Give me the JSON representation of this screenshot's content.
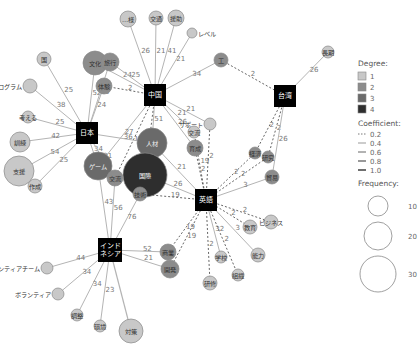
{
  "colors": {
    "degree1": "#c8c8c8",
    "degree2": "#8c8c8c",
    "degree3": "#6a6a6a",
    "degree4": "#2e2e2e",
    "hub": "#000000",
    "edge_solid": "#b4b4b4",
    "edge_dashed": "#555555"
  },
  "hubs": [
    {
      "id": "japan",
      "label": "日本",
      "x": 87,
      "y": 133,
      "size": 22
    },
    {
      "id": "china",
      "label": "中国",
      "x": 155,
      "y": 95,
      "size": 22
    },
    {
      "id": "taiwan",
      "label": "台湾",
      "x": 285,
      "y": 96,
      "size": 22
    },
    {
      "id": "english",
      "label": "英語",
      "x": 206,
      "y": 200,
      "size": 22
    },
    {
      "id": "indonesia",
      "label": "インド\nネシア",
      "x": 110,
      "y": 250,
      "size": 24
    }
  ],
  "nodes": [
    {
      "id": "n_sho",
      "label": "…様",
      "x": 128,
      "y": 19,
      "r": 8,
      "degree": 1
    },
    {
      "id": "n_kotsu",
      "label": "交通",
      "x": 156,
      "y": 18,
      "r": 7,
      "degree": 1
    },
    {
      "id": "n_enjo",
      "label": "援助",
      "x": 176,
      "y": 18,
      "r": 8,
      "degree": 1
    },
    {
      "id": "n_level",
      "label": "レベル",
      "x": 192,
      "y": 33,
      "r": 5,
      "degree": 1,
      "outside": true
    },
    {
      "id": "n_ko",
      "label": "工",
      "x": 221,
      "y": 60,
      "r": 7,
      "degree": 2
    },
    {
      "id": "n_jinkou",
      "label": "長期",
      "x": 328,
      "y": 52,
      "r": 6,
      "degree": 1
    },
    {
      "id": "n_bunka",
      "label": "文化",
      "x": 95,
      "y": 63,
      "r": 12,
      "degree": 2
    },
    {
      "id": "n_ryoko",
      "label": "旅行",
      "x": 110,
      "y": 62,
      "r": 9,
      "degree": 2
    },
    {
      "id": "n_tairiku",
      "label": "体験",
      "x": 104,
      "y": 86,
      "r": 8,
      "degree": 2
    },
    {
      "id": "n_kuni",
      "label": "国",
      "x": 44,
      "y": 59,
      "r": 7,
      "degree": 1
    },
    {
      "id": "n_program",
      "label": "プログラム",
      "x": 30,
      "y": 86,
      "r": 7,
      "degree": 1,
      "outside_left": true
    },
    {
      "id": "n_kangaeru",
      "label": "考える",
      "x": 28,
      "y": 117,
      "r": 6,
      "degree": 1
    },
    {
      "id": "n_kunren",
      "label": "訓練",
      "x": 20,
      "y": 142,
      "r": 10,
      "degree": 1
    },
    {
      "id": "n_shien",
      "label": "支援",
      "x": 19,
      "y": 171,
      "r": 15,
      "degree": 1
    },
    {
      "id": "n_sakusei",
      "label": "作成",
      "x": 35,
      "y": 186,
      "r": 7,
      "degree": 1
    },
    {
      "id": "n_jinzai",
      "label": "人材",
      "x": 152,
      "y": 143,
      "r": 15,
      "degree": 3
    },
    {
      "id": "n_support",
      "label": "サポート",
      "x": 210,
      "y": 124,
      "r": 6,
      "degree": 1,
      "outside_left": true
    },
    {
      "id": "n_ko2",
      "label": "交流",
      "x": 194,
      "y": 132,
      "r": 6,
      "degree": 1
    },
    {
      "id": "n_kyoiku",
      "label": "育成",
      "x": 195,
      "y": 148,
      "r": 8,
      "degree": 2
    },
    {
      "id": "n_game",
      "label": "ゲーム",
      "x": 98,
      "y": 166,
      "r": 14,
      "degree": 3
    },
    {
      "id": "n_kokusai",
      "label": "国際",
      "x": 145,
      "y": 175,
      "r": 22,
      "degree": 4
    },
    {
      "id": "n_shakai",
      "label": "交流",
      "x": 115,
      "y": 178,
      "r": 8,
      "degree": 2
    },
    {
      "id": "n_gijutsu",
      "label": "技術",
      "x": 140,
      "y": 194,
      "r": 7,
      "degree": 2
    },
    {
      "id": "n_keizai",
      "label": "経済",
      "x": 255,
      "y": 153,
      "r": 6,
      "degree": 2
    },
    {
      "id": "n_kenkyu",
      "label": "研究",
      "x": 268,
      "y": 157,
      "r": 6,
      "degree": 2
    },
    {
      "id": "n_bouei",
      "label": "貿易",
      "x": 272,
      "y": 177,
      "r": 7,
      "degree": 2
    },
    {
      "id": "n_kyouiku2",
      "label": "教育",
      "x": 250,
      "y": 227,
      "r": 7,
      "degree": 1
    },
    {
      "id": "n_nihongo",
      "label": "ビジネス",
      "x": 271,
      "y": 222,
      "r": 7,
      "degree": 1
    },
    {
      "id": "n_kinou",
      "label": "能力",
      "x": 258,
      "y": 255,
      "r": 7,
      "degree": 1
    },
    {
      "id": "n_gakko",
      "label": "学校",
      "x": 221,
      "y": 257,
      "r": 6,
      "degree": 1
    },
    {
      "id": "n_soshiki",
      "label": "組織",
      "x": 238,
      "y": 275,
      "r": 6,
      "degree": 1
    },
    {
      "id": "n_kaigi",
      "label": "研修",
      "x": 210,
      "y": 283,
      "r": 7,
      "degree": 1
    },
    {
      "id": "n_shougyo",
      "label": "商業",
      "x": 168,
      "y": 252,
      "r": 8,
      "degree": 2
    },
    {
      "id": "n_kaihatsu",
      "label": "開発",
      "x": 170,
      "y": 269,
      "r": 9,
      "degree": 2
    },
    {
      "id": "n_volteam",
      "label": "ボランティアチーム",
      "x": 47,
      "y": 268,
      "r": 6,
      "degree": 1,
      "outside_left": true
    },
    {
      "id": "n_volunteer",
      "label": "ボランティア",
      "x": 58,
      "y": 294,
      "r": 6,
      "degree": 1,
      "outside_left": true
    },
    {
      "id": "n_chosa",
      "label": "調整",
      "x": 77,
      "y": 315,
      "r": 6,
      "degree": 1
    },
    {
      "id": "n_kankyo",
      "label": "環境",
      "x": 100,
      "y": 326,
      "r": 6,
      "degree": 1
    },
    {
      "id": "n_taisaku",
      "label": "対策",
      "x": 131,
      "y": 331,
      "r": 12,
      "degree": 1
    }
  ],
  "edges": [
    {
      "from": "china",
      "to": "n_sho",
      "weight": "26",
      "style": "solid"
    },
    {
      "from": "china",
      "to": "n_kotsu",
      "weight": "21",
      "style": "solid"
    },
    {
      "from": "china",
      "to": "n_enjo",
      "weight": "41",
      "style": "solid"
    },
    {
      "from": "china",
      "to": "n_level",
      "weight": "21",
      "style": "solid"
    },
    {
      "from": "china",
      "to": "n_ko",
      "weight": "34",
      "style": "solid"
    },
    {
      "from": "china",
      "to": "n_bunka",
      "weight": "24",
      "style": "solid"
    },
    {
      "from": "china",
      "to": "n_ryoko",
      "weight": "25",
      "style": "solid"
    },
    {
      "from": "china",
      "to": "n_tairiku",
      "weight": "2",
      "style": "dashed"
    },
    {
      "from": "china",
      "to": "n_support",
      "weight": "21",
      "style": "solid"
    },
    {
      "from": "china",
      "to": "n_ko2",
      "weight": "21",
      "style": "solid"
    },
    {
      "from": "china",
      "to": "n_kyoiku",
      "weight": "26",
      "style": "solid"
    },
    {
      "from": "china",
      "to": "n_jinzai",
      "weight": "51",
      "style": "solid"
    },
    {
      "from": "china",
      "to": "n_kokusai",
      "weight": "2",
      "style": "dashed"
    },
    {
      "from": "china",
      "to": "n_shakai",
      "weight": "19",
      "style": "dashed"
    },
    {
      "from": "china",
      "to": "n_game",
      "weight": "27",
      "style": "solid"
    },
    {
      "from": "taiwan",
      "to": "n_ko",
      "weight": "2",
      "style": "dashed"
    },
    {
      "from": "taiwan",
      "to": "n_jinkou",
      "weight": "26",
      "style": "solid"
    },
    {
      "from": "taiwan",
      "to": "n_keizai",
      "weight": "2",
      "style": "dashed"
    },
    {
      "from": "taiwan",
      "to": "n_kenkyu",
      "weight": "2",
      "style": "dashed"
    },
    {
      "from": "taiwan",
      "to": "n_bouei",
      "weight": "26",
      "style": "solid"
    },
    {
      "from": "japan",
      "to": "n_kuni",
      "weight": "25",
      "style": "solid"
    },
    {
      "from": "japan",
      "to": "n_program",
      "weight": "38",
      "style": "solid"
    },
    {
      "from": "japan",
      "to": "n_kangaeru",
      "weight": "25",
      "style": "solid"
    },
    {
      "from": "japan",
      "to": "n_kunren",
      "weight": "42",
      "style": "solid"
    },
    {
      "from": "japan",
      "to": "n_shien",
      "weight": "54",
      "style": "solid"
    },
    {
      "from": "japan",
      "to": "n_sakusei",
      "weight": "25",
      "style": "solid"
    },
    {
      "from": "japan",
      "to": "n_bunka",
      "weight": "52",
      "style": "solid"
    },
    {
      "from": "japan",
      "to": "n_ryoko",
      "weight": "25",
      "style": "solid"
    },
    {
      "from": "japan",
      "to": "n_tairiku",
      "weight": "24",
      "style": "solid"
    },
    {
      "from": "japan",
      "to": "n_jinzai",
      "weight": "36",
      "style": "solid"
    },
    {
      "from": "japan",
      "to": "n_game",
      "weight": "34",
      "style": "solid"
    },
    {
      "from": "japan",
      "to": "n_shakai",
      "weight": "31",
      "style": "solid"
    },
    {
      "from": "english",
      "to": "n_kokusai",
      "weight": "26",
      "style": "solid"
    },
    {
      "from": "english",
      "to": "n_jinzai",
      "weight": "21",
      "style": "solid"
    },
    {
      "from": "english",
      "to": "n_gijutsu",
      "weight": "19",
      "style": "dashed"
    },
    {
      "from": "english",
      "to": "n_kyoiku",
      "weight": "2",
      "style": "dashed"
    },
    {
      "from": "english",
      "to": "n_ko2",
      "weight": "19",
      "style": "dashed"
    },
    {
      "from": "english",
      "to": "n_support",
      "weight": "2",
      "style": "dashed"
    },
    {
      "from": "english",
      "to": "n_keizai",
      "weight": "2",
      "style": "dashed"
    },
    {
      "from": "english",
      "to": "n_kenkyu",
      "weight": "2",
      "style": "dashed"
    },
    {
      "from": "english",
      "to": "n_bouei",
      "weight": "3",
      "style": "solid"
    },
    {
      "from": "english",
      "to": "n_nihongo",
      "weight": "2",
      "style": "dashed"
    },
    {
      "from": "english",
      "to": "n_kyouiku2",
      "weight": "2",
      "style": "dashed"
    },
    {
      "from": "english",
      "to": "n_kinou",
      "weight": "3",
      "style": "solid"
    },
    {
      "from": "english",
      "to": "n_gakko",
      "weight": "32",
      "style": "solid"
    },
    {
      "from": "english",
      "to": "n_soshiki",
      "weight": "2",
      "style": "dashed"
    },
    {
      "from": "english",
      "to": "n_kaigi",
      "weight": "2",
      "style": "dashed"
    },
    {
      "from": "english",
      "to": "n_shougyo",
      "weight": "19",
      "style": "dashed"
    },
    {
      "from": "english",
      "to": "n_kaihatsu",
      "weight": "19",
      "style": "dashed"
    },
    {
      "from": "indonesia",
      "to": "n_game",
      "weight": "43",
      "style": "solid"
    },
    {
      "from": "indonesia",
      "to": "n_shakai",
      "weight": "56",
      "style": "solid"
    },
    {
      "from": "indonesia",
      "to": "n_gijutsu",
      "weight": "76",
      "style": "solid"
    },
    {
      "from": "indonesia",
      "to": "n_shougyo",
      "weight": "52",
      "style": "solid"
    },
    {
      "from": "indonesia",
      "to": "n_kaihatsu",
      "weight": "21",
      "style": "solid"
    },
    {
      "from": "indonesia",
      "to": "n_volteam",
      "weight": "44",
      "style": "solid"
    },
    {
      "from": "indonesia",
      "to": "n_volunteer",
      "weight": "34",
      "style": "solid"
    },
    {
      "from": "indonesia",
      "to": "n_chosa",
      "weight": "34",
      "style": "solid"
    },
    {
      "from": "indonesia",
      "to": "n_kankyo",
      "weight": "23",
      "style": "solid"
    },
    {
      "from": "indonesia",
      "to": "n_taisaku",
      "weight": "",
      "style": "solid-dark"
    }
  ],
  "legend": {
    "degree_title": "Degree:",
    "degree_items": [
      {
        "label": "1",
        "color": "#c8c8c8"
      },
      {
        "label": "2",
        "color": "#8c8c8c"
      },
      {
        "label": "3",
        "color": "#6a6a6a"
      },
      {
        "label": "4",
        "color": "#2e2e2e"
      }
    ],
    "coefficient_title": "Coefficient:",
    "coefficient_items": [
      {
        "label": "0.2",
        "dash": true,
        "width": 0.8
      },
      {
        "label": "0.4",
        "dash": false,
        "width": 0.6
      },
      {
        "label": "0.6",
        "dash": false,
        "width": 0.9
      },
      {
        "label": "0.8",
        "dash": false,
        "width": 1.2
      },
      {
        "label": "1.0",
        "dash": false,
        "width": 1.7
      }
    ],
    "frequency_title": "Frequency:",
    "frequency_items": [
      {
        "label": "10",
        "r": 10
      },
      {
        "label": "20",
        "r": 14
      },
      {
        "label": "30",
        "r": 18
      }
    ]
  }
}
